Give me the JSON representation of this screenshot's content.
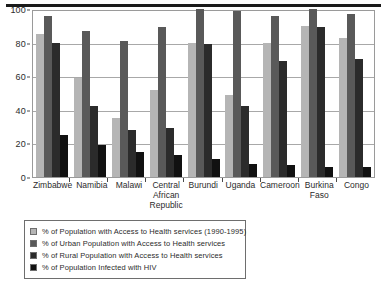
{
  "chart_data": {
    "type": "bar",
    "title": "",
    "subtitle": "",
    "xlabel": "",
    "ylabel": "",
    "ylim": [
      0,
      100
    ],
    "yticks": [
      0,
      20,
      40,
      60,
      80,
      100
    ],
    "grid": true,
    "legend_position": "below-left",
    "categories": [
      "Zimbabwe",
      "Namibia",
      "Malawi",
      "Central African Republic",
      "Burundi",
      "Uganda",
      "Cameroon",
      "Burkina Faso",
      "Congo"
    ],
    "category_lines": [
      [
        "Zimbabwe"
      ],
      [
        "Namibia"
      ],
      [
        "Malawi"
      ],
      [
        "Central",
        "African",
        "Republic"
      ],
      [
        "Burundi"
      ],
      [
        "Uganda"
      ],
      [
        "Cameroon"
      ],
      [
        "Burkina",
        "Faso"
      ],
      [
        "Congo"
      ]
    ],
    "series": [
      {
        "name": "% of Population with Access to Health services (1990-1995)",
        "color": "#b5b5b5",
        "values": [
          85,
          59,
          35,
          52,
          80,
          49,
          80,
          90,
          83
        ]
      },
      {
        "name": "% of Urban Population with Access to Health services",
        "color": "#595959",
        "values": [
          96,
          87,
          81,
          89,
          100,
          99,
          96,
          100,
          97
        ]
      },
      {
        "name": "% of Rural Population with Access to Health services",
        "color": "#2b2b2b",
        "values": [
          80,
          42,
          28,
          29,
          79,
          42,
          69,
          89,
          70
        ]
      },
      {
        "name": "% of Population Infected with HIV",
        "color": "#111111",
        "values": [
          25,
          19,
          15,
          13,
          11,
          8,
          7,
          6,
          6
        ]
      }
    ]
  },
  "legend": {
    "items": [
      {
        "label": "% of Population with Access to Health services (1990-1995)",
        "color": "#b5b5b5"
      },
      {
        "label": "% of Urban Population with Access to Health services",
        "color": "#595959"
      },
      {
        "label": "% of Rural Population with Access to Health services",
        "color": "#2b2b2b"
      },
      {
        "label": "% of Population Infected with HIV",
        "color": "#111111"
      }
    ]
  }
}
